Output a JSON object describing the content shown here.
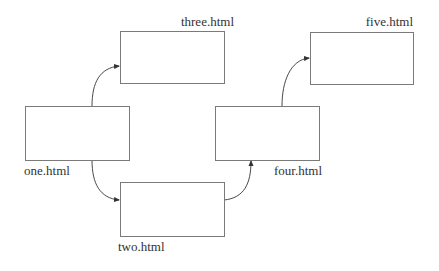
{
  "diagram": {
    "type": "page-flow",
    "nodes": [
      {
        "id": "one",
        "label": "one.html",
        "x": 25,
        "y": 106,
        "w": 104,
        "h": 54,
        "label_x": 25,
        "label_y": 175,
        "anchor": "start"
      },
      {
        "id": "two",
        "label": "two.html",
        "x": 120,
        "y": 182,
        "w": 104,
        "h": 54,
        "label_x": 118,
        "label_y": 251,
        "anchor": "start"
      },
      {
        "id": "three",
        "label": "three.html",
        "x": 120,
        "y": 31,
        "w": 104,
        "h": 52,
        "label_x": 234,
        "label_y": 26,
        "anchor": "end"
      },
      {
        "id": "four",
        "label": "four.html",
        "x": 215,
        "y": 106,
        "w": 104,
        "h": 54,
        "label_x": 273,
        "label_y": 175,
        "anchor": "start"
      },
      {
        "id": "five",
        "label": "five.html",
        "x": 310,
        "y": 32,
        "w": 103,
        "h": 52,
        "label_x": 413,
        "label_y": 26,
        "anchor": "end"
      }
    ],
    "edges": [
      {
        "from": "one",
        "to": "three"
      },
      {
        "from": "one",
        "to": "two"
      },
      {
        "from": "two",
        "to": "four"
      },
      {
        "from": "four",
        "to": "five"
      }
    ],
    "colors": {
      "box_stroke": "#7a7a7a",
      "edge": "#333333",
      "text": "#333333",
      "background": "#ffffff"
    }
  }
}
